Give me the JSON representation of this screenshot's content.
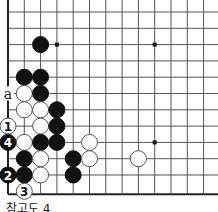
{
  "diagram": {
    "caption": "참고도 4",
    "grid": {
      "x0": 8,
      "y0": 12,
      "spacing": 16.3,
      "cols": 13,
      "rows": 12,
      "left_edge": true,
      "bottom_edge": true,
      "line_color": "#555555",
      "edge_color": "#222222"
    },
    "star_points": [
      [
        3,
        2
      ],
      [
        9,
        2
      ],
      [
        9,
        8
      ]
    ],
    "stones": [
      {
        "color": "black",
        "col": 2,
        "row": 2
      },
      {
        "color": "black",
        "col": 1,
        "row": 4
      },
      {
        "color": "black",
        "col": 2,
        "row": 4
      },
      {
        "color": "white",
        "col": 1,
        "row": 5
      },
      {
        "color": "black",
        "col": 2,
        "row": 5
      },
      {
        "color": "white",
        "col": 1,
        "row": 6
      },
      {
        "color": "white",
        "col": 2,
        "row": 6
      },
      {
        "color": "black",
        "col": 3,
        "row": 6
      },
      {
        "color": "white",
        "col": 0,
        "row": 7,
        "label": "1"
      },
      {
        "color": "white",
        "col": 2,
        "row": 7
      },
      {
        "color": "black",
        "col": 3,
        "row": 7
      },
      {
        "color": "black",
        "col": 0,
        "row": 8,
        "label": "4"
      },
      {
        "color": "white",
        "col": 1,
        "row": 8
      },
      {
        "color": "black",
        "col": 2,
        "row": 8
      },
      {
        "color": "black",
        "col": 3,
        "row": 8
      },
      {
        "color": "white",
        "col": 5,
        "row": 8
      },
      {
        "color": "black",
        "col": 1,
        "row": 9
      },
      {
        "color": "white",
        "col": 2,
        "row": 9
      },
      {
        "color": "black",
        "col": 4,
        "row": 9
      },
      {
        "color": "white",
        "col": 5,
        "row": 9
      },
      {
        "color": "white",
        "col": 8,
        "row": 9
      },
      {
        "color": "black",
        "col": 0,
        "row": 10,
        "label": "2"
      },
      {
        "color": "black",
        "col": 1,
        "row": 10
      },
      {
        "color": "white",
        "col": 2,
        "row": 10
      },
      {
        "color": "black",
        "col": 4,
        "row": 10
      },
      {
        "color": "white",
        "col": 1,
        "row": 11,
        "label": "3"
      }
    ],
    "markers": [
      {
        "type": "letter",
        "text": "a",
        "col": 0,
        "row": 5
      }
    ]
  }
}
